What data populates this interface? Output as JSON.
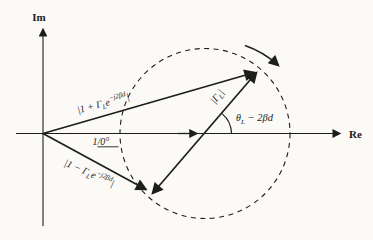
{
  "figure": {
    "colors": {
      "background": "#fbfaf7",
      "ink": "#1d1d1b"
    },
    "axes": {
      "im": "Im",
      "re": "Re"
    },
    "labels": {
      "sum_vector": {
        "pre": "|1 + Γ",
        "sub": "L",
        "base": "e",
        "sup": "−j2βd",
        "post": "|"
      },
      "diff_vector": {
        "pre": "|1 − Γ",
        "sub": "L",
        "base": "e",
        "sup": "−j2βd",
        "post": "|"
      },
      "unit_vector": {
        "coeff": "1",
        "angle": "/0°"
      },
      "gamma_magnitude": {
        "pre": "|Γ",
        "sub": "L",
        "post": "|"
      },
      "phase_angle": {
        "pre": "θ",
        "sub": "L",
        "post": " − 2βd"
      }
    }
  }
}
